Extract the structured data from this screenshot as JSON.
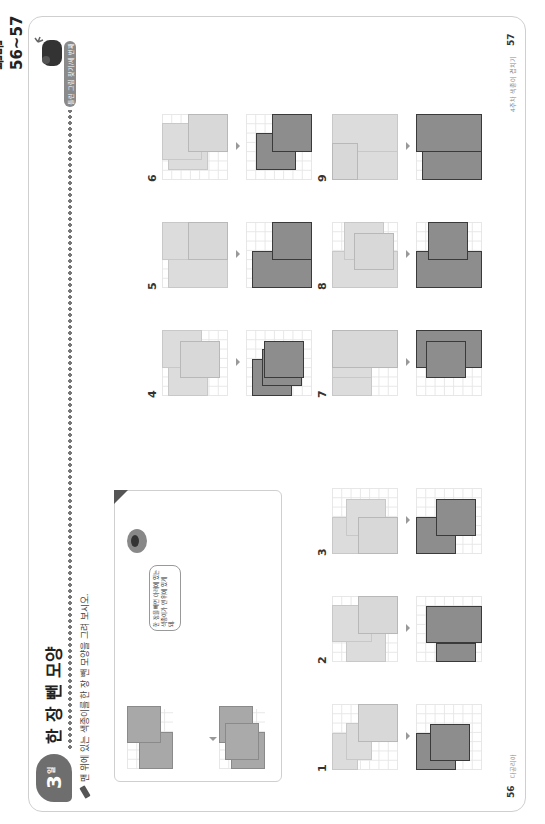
{
  "page_range": "본문 56~57쪽",
  "lesson": {
    "badge_number": "3",
    "badge_unit": "일",
    "title": "한 장 뺀 모양",
    "tag": "틀린 그림 찾기/세 번째",
    "instruction": "맨 위에 있는 색종이를 한 장 뺀 모양을 그려 보시오."
  },
  "example": {
    "speech": "한 장을 빼면 아래에 있는 색종이가 맨 위에 있게 돼."
  },
  "problems": [
    {
      "number": "1"
    },
    {
      "number": "2"
    },
    {
      "number": "3"
    },
    {
      "number": "4"
    },
    {
      "number": "5"
    },
    {
      "number": "6"
    },
    {
      "number": "7"
    },
    {
      "number": "8"
    },
    {
      "number": "9"
    }
  ],
  "footer": {
    "left_page": "56",
    "left_text": "다공리아",
    "right_page": "57",
    "right_text": "4주차 색종이 겹치기"
  },
  "colors": {
    "light_paper": "#dcdcdc",
    "answer_paper": "#8d8d8d",
    "badge": "#6e6e6e"
  }
}
